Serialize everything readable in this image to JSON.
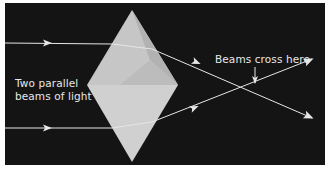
{
  "diagram": {
    "colors": {
      "background": "#141414",
      "border": "#ffffff",
      "prism_light": "#c9c9c9",
      "prism_upper_right": "#b4b4b4",
      "prism_lower": "#d2d2d2",
      "ray": "#e6e6e6"
    },
    "labels": {
      "incoming_line1": "Two parallel",
      "incoming_line2": "beams of light",
      "crossing": "Beams cross here"
    },
    "shapes": {
      "prism": {
        "top": [
          132,
          10
        ],
        "left": [
          87,
          85
        ],
        "right": [
          178,
          85
        ],
        "bottom": [
          132,
          162
        ]
      },
      "beam_upper": {
        "start": [
          5,
          43
        ],
        "enter": [
          112,
          44
        ],
        "exit": [
          152,
          49
        ],
        "end": [
          312,
          118
        ]
      },
      "beam_lower": {
        "start": [
          5,
          128
        ],
        "enter": [
          112,
          128
        ],
        "exit": [
          152,
          122
        ],
        "end": [
          312,
          59
        ]
      },
      "crossing_point": [
        255,
        85
      ]
    }
  }
}
